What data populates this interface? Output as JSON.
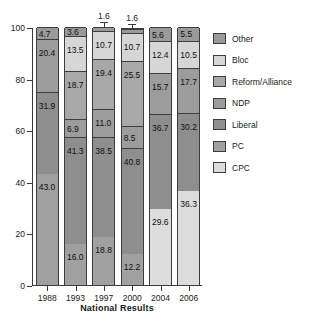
{
  "chart_data": {
    "type": "bar",
    "subtype": "stacked-bar-100-percent",
    "title": "",
    "xlabel": "National Results",
    "ylabel": "",
    "ylim": [
      0,
      100
    ],
    "yticks": [
      0,
      20,
      40,
      60,
      80,
      100
    ],
    "grid": false,
    "legend_position": "right",
    "categories": [
      "1988",
      "1993",
      "1997",
      "2000",
      "2004",
      "2006"
    ],
    "stack_order_bottom_to_top": [
      "PC",
      "CPC",
      "Liberal",
      "NDP",
      "Reform/Alliance",
      "Bloc",
      "Other"
    ],
    "series": [
      {
        "name": "PC",
        "values": [
          43.0,
          16.0,
          18.8,
          12.2,
          null,
          null
        ]
      },
      {
        "name": "CPC",
        "values": [
          null,
          null,
          null,
          null,
          29.6,
          36.3
        ]
      },
      {
        "name": "Liberal",
        "values": [
          31.9,
          41.3,
          38.5,
          40.8,
          36.7,
          30.2
        ]
      },
      {
        "name": "NDP",
        "values": [
          20.4,
          6.9,
          11.0,
          8.5,
          15.7,
          17.7
        ]
      },
      {
        "name": "Reform/Alliance",
        "values": [
          null,
          18.7,
          19.4,
          25.5,
          null,
          null
        ]
      },
      {
        "name": "Bloc",
        "values": [
          null,
          13.5,
          10.7,
          10.7,
          12.4,
          10.5
        ]
      },
      {
        "name": "Other",
        "values": [
          4.7,
          3.6,
          1.6,
          1.6,
          5.6,
          5.5
        ]
      }
    ],
    "annotations": [
      {
        "text": "1.6",
        "category": "1997",
        "series": "Other",
        "style": "leader-line"
      },
      {
        "text": "1.6",
        "category": "2000",
        "series": "Other",
        "style": "leader-line"
      }
    ],
    "legend": [
      {
        "label": "Other",
        "color": "#9a9a9a"
      },
      {
        "label": "Bloc",
        "color": "#d6d6d6"
      },
      {
        "label": "Reform/Alliance",
        "color": "#a8a8a8"
      },
      {
        "label": "NDP",
        "color": "#9c9c9c"
      },
      {
        "label": "Liberal",
        "color": "#8e8e8e"
      },
      {
        "label": "PC",
        "color": "#a0a0a0"
      },
      {
        "label": "CPC",
        "color": "#dcdcdc"
      }
    ]
  },
  "axis": {
    "y_tick_labels": [
      "0",
      "20",
      "40",
      "60",
      "80",
      "100"
    ],
    "x_tick_labels": [
      "1988",
      "1993",
      "1997",
      "2000",
      "2004",
      "2006"
    ],
    "x_axis_title": "National Results"
  },
  "colors": {
    "Other": "#9a9a9a",
    "Bloc": "#d6d6d6",
    "Reform/Alliance": "#a8a8a8",
    "NDP": "#9c9c9c",
    "Liberal": "#8e8e8e",
    "PC": "#a0a0a0",
    "CPC": "#dcdcdc",
    "outline": "#3d3d3d",
    "axis": "#3a3a3a",
    "text": "#1a1a1a",
    "background": "#ffffff"
  }
}
